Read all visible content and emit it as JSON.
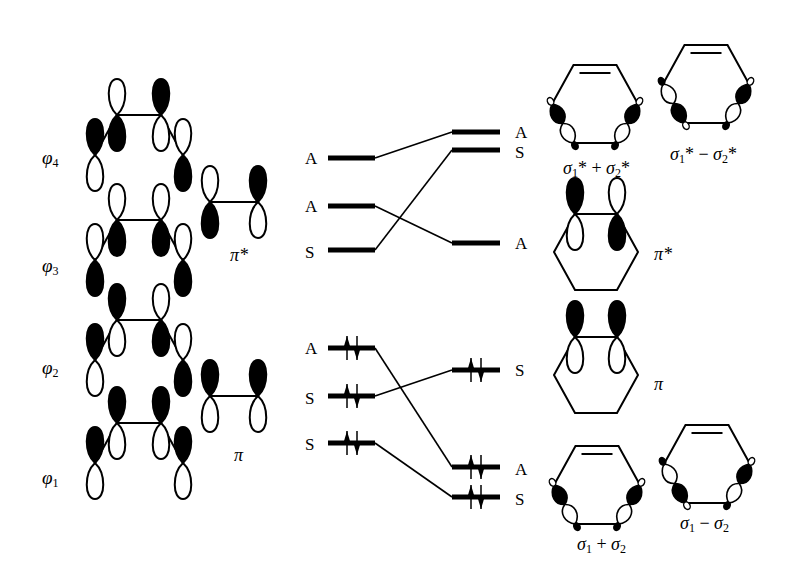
{
  "figure": {
    "type": "orbital correlation diagram"
  },
  "left_column": {
    "diene_orbitals": [
      {
        "id": "phi4",
        "label_main": "φ",
        "label_sub": "4",
        "phases": [
          "up-dark",
          "down-dark",
          "up-dark",
          "down-dark"
        ]
      },
      {
        "id": "phi3",
        "label_main": "φ",
        "label_sub": "3",
        "phases": [
          "down-dark",
          "down-dark",
          "down-dark",
          "down-dark"
        ]
      },
      {
        "id": "phi2",
        "label_main": "φ",
        "label_sub": "2",
        "phases": [
          "up-dark",
          "up-dark",
          "down-dark",
          "down-dark"
        ]
      },
      {
        "id": "phi1",
        "label_main": "φ",
        "label_sub": "1",
        "phases": [
          "up-dark",
          "up-dark",
          "up-dark",
          "up-dark"
        ]
      }
    ],
    "ethylene_orbitals": [
      {
        "id": "pi_star",
        "label": "π*"
      },
      {
        "id": "pi",
        "label": "π"
      }
    ]
  },
  "correlation": {
    "left_levels": [
      {
        "symmetry": "A",
        "y": 158,
        "electrons": 0
      },
      {
        "symmetry": "A",
        "y": 206,
        "electrons": 0
      },
      {
        "symmetry": "S",
        "y": 250,
        "electrons": 0
      },
      {
        "symmetry": "A",
        "y": 348,
        "electrons": 2
      },
      {
        "symmetry": "S",
        "y": 396,
        "electrons": 2
      },
      {
        "symmetry": "S",
        "y": 443,
        "electrons": 2
      }
    ],
    "right_levels": [
      {
        "symmetry": "A",
        "y": 132,
        "electrons": 0
      },
      {
        "symmetry": "S",
        "y": 150,
        "electrons": 0
      },
      {
        "symmetry": "A",
        "y": 243,
        "electrons": 0
      },
      {
        "symmetry": "S",
        "y": 370,
        "electrons": 2
      },
      {
        "symmetry": "A",
        "y": 467,
        "electrons": 2
      },
      {
        "symmetry": "S",
        "y": 497,
        "electrons": 2
      }
    ],
    "connections": [
      [
        0,
        0
      ],
      [
        1,
        2
      ],
      [
        2,
        1
      ],
      [
        3,
        4
      ],
      [
        4,
        3
      ],
      [
        5,
        5
      ]
    ]
  },
  "right_column": {
    "orbitals": [
      {
        "id": "sig_star_plus",
        "label": "σ1* + σ2*",
        "parts": [
          "σ",
          "1",
          "* + ",
          "σ",
          "2",
          "*"
        ]
      },
      {
        "id": "sig_star_minus",
        "label": "σ1* − σ2*",
        "parts": [
          "σ",
          "1",
          "* − ",
          "σ",
          "2",
          "*"
        ]
      },
      {
        "id": "pi_star_ring",
        "label": "π*"
      },
      {
        "id": "pi_ring",
        "label": "π"
      },
      {
        "id": "sig_plus",
        "label": "σ1 + σ2",
        "parts": [
          "σ",
          "1",
          " + ",
          "σ",
          "2",
          ""
        ]
      },
      {
        "id": "sig_minus",
        "label": "σ1 − σ2",
        "parts": [
          "σ",
          "1",
          " − ",
          "σ",
          "2",
          ""
        ]
      }
    ]
  }
}
